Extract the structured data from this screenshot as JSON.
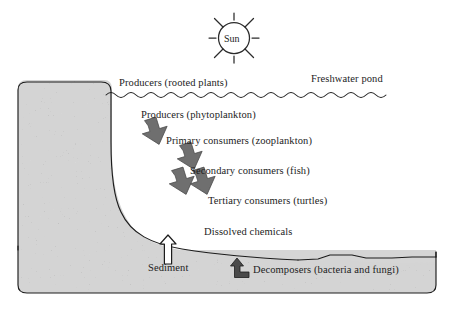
{
  "diagram": {
    "sun": {
      "label": "Sun",
      "icon": "sun-icon",
      "rays": 8
    },
    "water": {
      "surface_label": "Freshwater pond",
      "surface_icon": "wavy-water-line-icon"
    },
    "labels": {
      "producers_rooted": "Producers (rooted plants)",
      "producers_phyto": "Producers (phytoplankton)",
      "primary_consumers": "Primary consumers (zooplankton)",
      "secondary_consumers": "Secondary consumers (fish)",
      "tertiary_consumers": "Tertiary consumers (turtles)",
      "dissolved_chemicals": "Dissolved chemicals",
      "sediment": "Sediment",
      "decomposers": "Decomposers (bacteria and fungi)"
    },
    "arrows": {
      "chain_icon": "arrow-down-right-icon",
      "sediment_icon": "arrow-up-icon",
      "decomposer_icon": "elbow-arrow-up-icon",
      "chain_count": 4
    },
    "colors": {
      "background": "#ffffff",
      "sediment_fill": "#d5d5d5",
      "outline": "#1c1c1c",
      "chain_arrow": "#737373",
      "text": "#1c1c1c"
    }
  }
}
